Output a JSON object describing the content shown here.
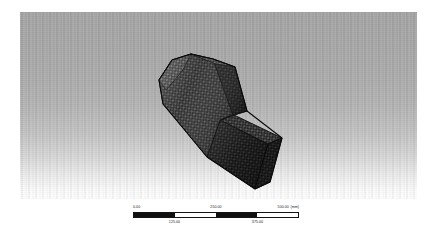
{
  "app": {
    "view_type": "3d-finite-element-mesh-viewport",
    "background_style": "vertical-gradient-grey-to-white"
  },
  "viewport": {
    "label": "3D model viewport",
    "model": {
      "name": "projectile-mesh-body",
      "description": "Tetrahedral surface mesh of an arrow/bullet shaped solid body",
      "mesh_style": "triangular-surface-mesh",
      "mesh_color": "#4a4a4a",
      "edge_color": "#1c1c1c",
      "orientation": "isometric-tilted"
    }
  },
  "scale_bar": {
    "name": "scale-bar",
    "units": "(mm)",
    "segments": [
      "dark",
      "light",
      "dark",
      "light"
    ],
    "top_labels": [
      "0.00",
      "250.00",
      "500.00"
    ],
    "bottom_labels": [
      "125.00",
      "375.00"
    ],
    "ticks": [
      0.0,
      125.0,
      250.0,
      375.0,
      500.0
    ],
    "min": 0.0,
    "max": 500.0
  },
  "colors": {
    "background_top": "#a6a6a6",
    "background_bottom": "#ffffff",
    "page_background": "#ffffff",
    "scale_dark": "#101010",
    "scale_light": "#ffffff",
    "text": "#1a1a1a"
  }
}
